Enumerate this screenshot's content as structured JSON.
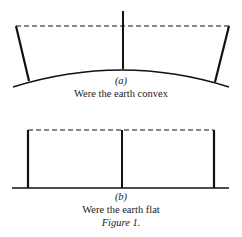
{
  "figure": {
    "panel_a": {
      "label": "(a)",
      "caption": "Were the earth convex"
    },
    "panel_b": {
      "label": "(b)",
      "caption": "Were the earth flat"
    },
    "title": "Figure 1."
  }
}
